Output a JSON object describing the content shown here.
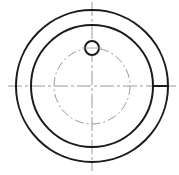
{
  "drawing": {
    "type": "engineering-view",
    "background": "#ffffff",
    "line_color": "#1a1a1a",
    "centerline_color": "#9a9a9a",
    "center": {
      "x": 92,
      "y": 86
    },
    "outer_circle": {
      "r": 76,
      "stroke_width": 2
    },
    "inner_circle": {
      "r": 61,
      "stroke_width": 2
    },
    "pitch_circle": {
      "r": 38,
      "dashed": true
    },
    "hole": {
      "cx": 92,
      "cy": 48,
      "r": 7,
      "stroke_width": 2
    },
    "slot_line": {
      "x1": 154,
      "x2": 169,
      "y": 86,
      "stroke_width": 2
    },
    "centerlines": {
      "horizontal": {
        "x1": 8,
        "x2": 176,
        "y": 86
      },
      "vertical": {
        "x": 92,
        "y1": 2,
        "y2": 171
      }
    }
  }
}
